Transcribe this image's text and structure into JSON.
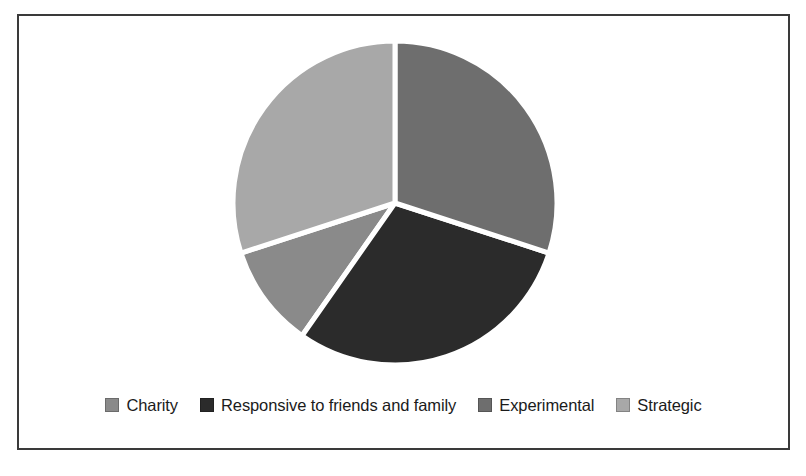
{
  "chart_data": {
    "type": "pie",
    "title": "",
    "subtitle": "",
    "xlabel": "",
    "ylabel": "",
    "grid": false,
    "legend_position": "bottom",
    "start_angle_deg": 0,
    "direction": "clockwise",
    "categories": [
      "Charity",
      "Responsive to friends and family",
      "Experimental",
      "Strategic"
    ],
    "values": [
      10.3,
      29.7,
      30.0,
      30.0
    ],
    "slices": [
      {
        "label": "Charity",
        "value": 10.3,
        "angle_deg": 37,
        "start_deg": 215,
        "end_deg": 252,
        "color": "#8a8a8a"
      },
      {
        "label": "Responsive to friends and family",
        "value": 29.7,
        "angle_deg": 107,
        "start_deg": 108,
        "end_deg": 215,
        "color": "#2b2b2b"
      },
      {
        "label": "Experimental",
        "value": 30.0,
        "angle_deg": 108,
        "start_deg": 0,
        "end_deg": 108,
        "color": "#6e6e6e"
      },
      {
        "label": "Strategic",
        "value": 30.0,
        "angle_deg": 108,
        "start_deg": 252,
        "end_deg": 360,
        "color": "#a8a8a8"
      }
    ],
    "separator_color": "#ffffff",
    "background_color": "#ffffff",
    "frame_color": "#3a3a3a"
  },
  "legend": {
    "items": [
      {
        "label": "Charity",
        "color": "#8a8a8a",
        "swatch": "legend-swatch-charity"
      },
      {
        "label": "Responsive to friends and family",
        "color": "#2b2b2b",
        "swatch": "legend-swatch-responsive"
      },
      {
        "label": "Experimental",
        "color": "#6e6e6e",
        "swatch": "legend-swatch-experimental"
      },
      {
        "label": "Strategic",
        "color": "#a8a8a8",
        "swatch": "legend-swatch-strategic"
      }
    ]
  }
}
